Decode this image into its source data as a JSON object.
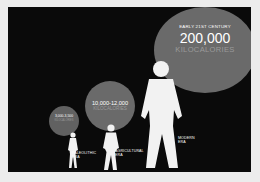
{
  "eras": [
    {
      "label_line1": "PALEOLITHIC",
      "label_line2": "ERA",
      "value": "3,000-3,500",
      "unit": "KILOCALORIES"
    },
    {
      "label_line1": "AGRICULTURAL",
      "label_line2": "ERA",
      "value": "10,000-12,000",
      "unit": "KILOCALORIES"
    },
    {
      "label_line1": "MODERN",
      "label_line2": "ERA",
      "heading": "EARLY 21ST CENTURY",
      "value": "200,000",
      "unit": "KILOCALORIES"
    }
  ],
  "colors": {
    "background": "#0a0a0a",
    "circle": "#6a6a6a",
    "figure": "#f2f2f2",
    "text": "#ffffff",
    "subtext": "#9a9a9a"
  }
}
